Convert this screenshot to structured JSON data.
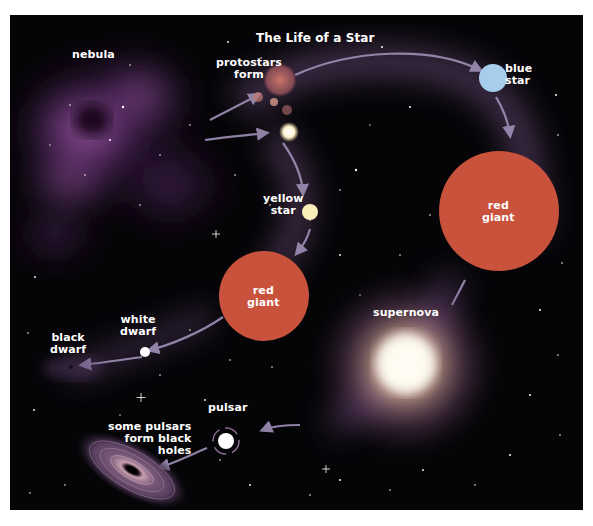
{
  "diagram": {
    "title": "The Life of a Star",
    "colors": {
      "background": "#050507",
      "nebula": "#8a4a9a",
      "path_glow": "#6a4c78",
      "arrow": "#9a8ab0",
      "protostar": "#c07060",
      "blue_star": "#9ec8e8",
      "yellow_star": "#f8f0b0",
      "red_giant": "#c8503a",
      "supernova_core": "#ffffff",
      "supernova_halo": "#e8c0a0",
      "white_dwarf": "#ffffff",
      "pulsar": "#ffffff",
      "black_hole_disk": "#7a6a80"
    },
    "labels": {
      "nebula": "nebula",
      "protostars_line1": "protostars",
      "protostars_line2": "form",
      "blue_star_line1": "blue",
      "blue_star_line2": "star",
      "yellow_star_line1": "yellow",
      "yellow_star_line2": "star",
      "red_giant_small_line1": "red",
      "red_giant_small_line2": "giant",
      "red_giant_large_line1": "red",
      "red_giant_large_line2": "giant",
      "supernova": "supernova",
      "white_dwarf_line1": "white",
      "white_dwarf_line2": "dwarf",
      "black_dwarf_line1": "black",
      "black_dwarf_line2": "dwarf",
      "pulsar": "pulsar",
      "black_holes_line1": "some pulsars",
      "black_holes_line2": "form black",
      "black_holes_line3": "holes"
    },
    "stages": [
      {
        "name": "nebula",
        "next": [
          "protostars form"
        ]
      },
      {
        "name": "protostars form",
        "next": [
          "blue star",
          "yellow star"
        ]
      },
      {
        "name": "blue star",
        "next": [
          "red giant (large)"
        ]
      },
      {
        "name": "red giant (large)",
        "next": [
          "supernova"
        ]
      },
      {
        "name": "supernova",
        "next": [
          "pulsar"
        ]
      },
      {
        "name": "pulsar",
        "next": [
          "some pulsars form black holes"
        ]
      },
      {
        "name": "yellow star",
        "next": [
          "red giant (small)"
        ]
      },
      {
        "name": "red giant (small)",
        "next": [
          "white dwarf"
        ]
      },
      {
        "name": "white dwarf",
        "next": [
          "black dwarf"
        ]
      }
    ]
  }
}
